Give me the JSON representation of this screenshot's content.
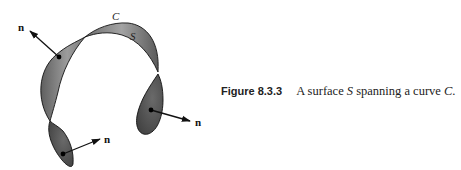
{
  "figure": {
    "labels": {
      "curve": "C",
      "surface": "S",
      "normal": "n"
    },
    "normal_vector_count": 3,
    "colors": {
      "surface_fill": "#8a8a8a",
      "surface_dark": "#555555",
      "outline": "#111111",
      "arrow": "#111111"
    }
  },
  "caption": {
    "number": "Figure 8.3.3",
    "text_before": "A surface ",
    "surface_symbol": "S",
    "text_middle": " spanning a curve ",
    "curve_symbol": "C",
    "text_after": "."
  }
}
